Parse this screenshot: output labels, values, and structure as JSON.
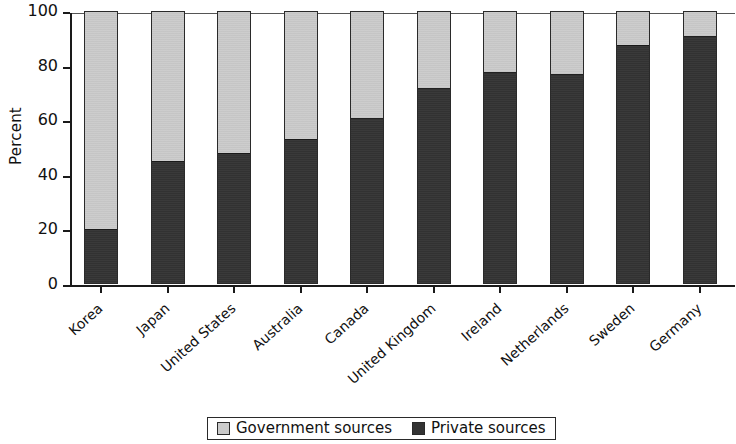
{
  "chart_data": {
    "type": "bar",
    "stacked": true,
    "percent_stacked": true,
    "title": "",
    "subtitle": "",
    "xlabel": "",
    "ylabel": "Percent",
    "ylim": [
      0,
      100
    ],
    "yticks": [
      0,
      20,
      40,
      60,
      80,
      100
    ],
    "ytick_labels": [
      "0",
      "20",
      "40",
      "60",
      "80",
      "100"
    ],
    "grid": false,
    "legend_position": "bottom",
    "categories": [
      "Korea",
      "Japan",
      "United States",
      "Australia",
      "Canada",
      "United Kingdom",
      "Ireland",
      "Netherlands",
      "Sweden",
      "Germany"
    ],
    "series": [
      {
        "name": "Private sources",
        "color": "#333333",
        "values": [
          20,
          45,
          48,
          53,
          61,
          72,
          78,
          77,
          88,
          91
        ]
      },
      {
        "name": "Government sources",
        "color": "#cbcbcb",
        "values": [
          80,
          55,
          52,
          47,
          39,
          28,
          22,
          23,
          12,
          9
        ]
      }
    ],
    "legend": [
      {
        "label": "Government sources",
        "color": "#cbcbcb",
        "swatch": "gov"
      },
      {
        "label": "Private sources",
        "color": "#333333",
        "swatch": "priv"
      }
    ]
  }
}
